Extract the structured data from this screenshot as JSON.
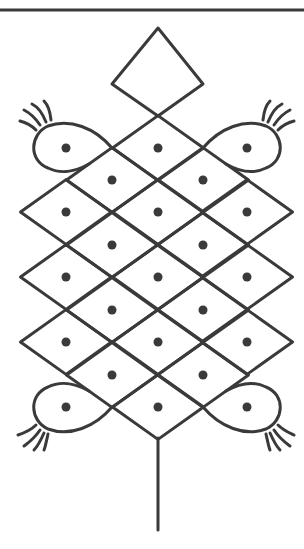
{
  "figure": {
    "stroke_color": "#3a3a3a",
    "dot_color": "#3a3a3a",
    "background": "#ffffff",
    "dot_count": 21,
    "dot_rows": [
      {
        "y": 148,
        "x": [
          66,
          158,
          247
        ]
      },
      {
        "y": 180,
        "x": [
          112,
          203
        ]
      },
      {
        "y": 212,
        "x": [
          66,
          158,
          247
        ]
      },
      {
        "y": 245,
        "x": [
          112,
          203
        ]
      },
      {
        "y": 277,
        "x": [
          66,
          158,
          247
        ]
      },
      {
        "y": 310,
        "x": [
          112,
          203
        ]
      },
      {
        "y": 342,
        "x": [
          66,
          158,
          247
        ]
      },
      {
        "y": 375,
        "x": [
          112,
          203
        ]
      },
      {
        "y": 407,
        "x": [
          66,
          158,
          247
        ]
      }
    ]
  },
  "caption": {
    "text": ""
  }
}
